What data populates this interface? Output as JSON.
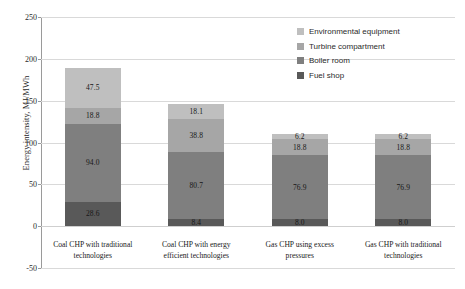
{
  "chart_data": {
    "type": "bar",
    "subtype": "stacked-column",
    "title": "",
    "xlabel": "",
    "ylabel": "Energy intensity, MJ/MWh",
    "ylim": [
      -50,
      250
    ],
    "ytick_step": 50,
    "yticks": [
      250,
      200,
      150,
      100,
      50,
      0,
      -50
    ],
    "ytick_labels": [
      "250",
      "200",
      "150",
      "100",
      "50",
      "0",
      "-50"
    ],
    "grid": true,
    "grid_axis": "y",
    "legend_position": "upper-right-inside",
    "categories": [
      "Coal CHP with traditional technologies",
      "Coal CHP with energy efficient technologies",
      "Gas CHP using excess pressures",
      "Gas CHP with traditional technologies"
    ],
    "series": [
      {
        "name": "Fuel shop",
        "color": "#595959",
        "values": [
          28.6,
          8.4,
          8.0,
          8.0
        ]
      },
      {
        "name": "Boiler room",
        "color": "#7f7f7f",
        "values": [
          94.0,
          80.7,
          76.9,
          76.9
        ]
      },
      {
        "name": "Turbine compartment",
        "color": "#a6a6a6",
        "values": [
          18.8,
          38.8,
          18.8,
          18.8
        ]
      },
      {
        "name": "Environmental equipment",
        "color": "#bfbfbf",
        "values": [
          47.5,
          18.1,
          6.2,
          6.2
        ]
      }
    ],
    "totals": [
      188.9,
      146.0,
      109.9,
      109.9
    ],
    "value_labels": [
      [
        "28.6",
        "94.0",
        "18.8",
        "47.5"
      ],
      [
        "8.4",
        "80.7",
        "38.8",
        "18.1"
      ],
      [
        "8.0",
        "76.9",
        "18.8",
        "6.2"
      ],
      [
        "8.0",
        "76.9",
        "18.8",
        "6.2"
      ]
    ]
  },
  "legend": {
    "items": [
      {
        "label": "Environmental equipment",
        "color": "#bfbfbf"
      },
      {
        "label": "Turbine compartment",
        "color": "#a6a6a6"
      },
      {
        "label": "Boiler room",
        "color": "#7f7f7f"
      },
      {
        "label": "Fuel shop",
        "color": "#595959"
      }
    ]
  },
  "axis": {
    "y_title": "Energy intensity, MJ/MWh"
  },
  "category_lines": [
    [
      "Coal CHP with traditional",
      "technologies"
    ],
    [
      "Coal CHP with energy",
      "efficient technologies"
    ],
    [
      "Gas CHP using excess",
      "pressures"
    ],
    [
      "Gas CHP with traditional",
      "technologies"
    ]
  ]
}
